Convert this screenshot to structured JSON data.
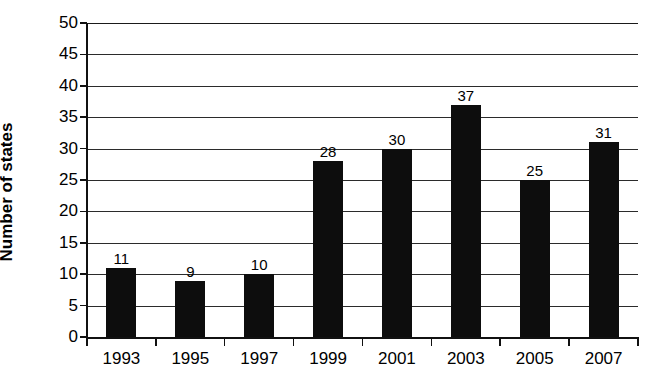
{
  "chart_data": {
    "type": "bar",
    "title": "",
    "subtitle": "",
    "xlabel": "",
    "ylabel": "Number of states",
    "categories": [
      "1993",
      "1995",
      "1997",
      "1999",
      "2001",
      "2003",
      "2005",
      "2007"
    ],
    "values": [
      11,
      9,
      10,
      28,
      30,
      37,
      25,
      31
    ],
    "data_labels": [
      "11",
      "9",
      "10",
      "28",
      "30",
      "37",
      "25",
      "31"
    ],
    "ylim": [
      0,
      50
    ],
    "y_ticks": [
      0,
      5,
      10,
      15,
      20,
      25,
      30,
      35,
      40,
      45,
      50
    ],
    "y_tick_labels": [
      "0",
      "5",
      "10",
      "15",
      "20",
      "25",
      "30",
      "35",
      "40",
      "45",
      "50"
    ],
    "grid": "horizontal",
    "legend": "none",
    "bar_color": "#0d0d0d",
    "grid_color": "#2b2b2b",
    "axis_color": "#111111",
    "background_color": "#ffffff",
    "annotations": []
  }
}
